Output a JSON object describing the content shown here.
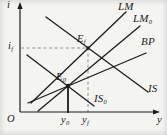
{
  "figure": {
    "type": "economics-diagram",
    "model": "IS-LM-BP",
    "colors": {
      "background": "#f4f5f1",
      "ink": "#1c1c1c",
      "guide": "#8f9089"
    },
    "axes": {
      "y_axis_label": {
        "base": "i",
        "sub": ""
      },
      "x_axis_label": {
        "base": "y",
        "sub": ""
      },
      "origin_label": {
        "base": "O",
        "sub": ""
      }
    },
    "curves": [
      {
        "name": "lm-curve",
        "label": {
          "base": "LM",
          "sub": ""
        },
        "x1": 31,
        "y1": 103,
        "x2": 126,
        "y2": 12,
        "label_x": 118,
        "label_y": 1
      },
      {
        "name": "lm0-curve",
        "label": {
          "base": "LM",
          "sub": "0"
        },
        "x1": 38,
        "y1": 111,
        "x2": 140,
        "y2": 26,
        "label_x": 133,
        "label_y": 13
      },
      {
        "name": "bp-curve",
        "label": {
          "base": "BP",
          "sub": ""
        },
        "x1": 28,
        "y1": 103,
        "x2": 146,
        "y2": 53,
        "label_x": 141,
        "label_y": 36
      },
      {
        "name": "is-curve",
        "label": {
          "base": "IS",
          "sub": ""
        },
        "x1": 46,
        "y1": 17,
        "x2": 148,
        "y2": 92,
        "label_x": 148,
        "label_y": 83
      },
      {
        "name": "is0-curve",
        "label": {
          "base": "IS",
          "sub": "0"
        },
        "x1": 27,
        "y1": 55,
        "x2": 94,
        "y2": 106,
        "label_x": 94,
        "label_y": 93
      }
    ],
    "points": [
      {
        "name": "ef-point",
        "label": {
          "base": "E",
          "sub": "f"
        },
        "x": 88,
        "y": 48,
        "r": 1.7,
        "label_x": 77,
        "label_y": 33
      },
      {
        "name": "e0-point",
        "label": {
          "base": "E",
          "sub": "0"
        },
        "x": 68,
        "y": 86,
        "r": 2.2,
        "label_x": 56,
        "label_y": 71
      }
    ],
    "guides": [
      {
        "name": "if-dashed-horizontal",
        "x1": 21,
        "y1": 48,
        "x2": 88,
        "y2": 48,
        "style": "dashed"
      },
      {
        "name": "yf-dashed-vertical",
        "x1": 88,
        "y1": 48,
        "x2": 88,
        "y2": 112,
        "style": "dashed"
      },
      {
        "name": "y0-solid-vertical",
        "x1": 68,
        "y1": 86,
        "x2": 68,
        "y2": 113,
        "style": "solid"
      }
    ],
    "tick_labels": [
      {
        "name": "if-tick-label",
        "label": {
          "base": "i",
          "sub": "f"
        },
        "x": 8,
        "y": 40
      },
      {
        "name": "y0-tick-label",
        "label": {
          "base": "y",
          "sub": "0"
        },
        "x": 61,
        "y": 114
      },
      {
        "name": "yf-tick-label",
        "label": {
          "base": "y",
          "sub": "f"
        },
        "x": 82,
        "y": 114
      }
    ],
    "axis_labels": [
      {
        "name": "i-axis-label",
        "key": "y_axis_label",
        "x": 7,
        "y": -1
      },
      {
        "name": "y-axis-label",
        "key": "x_axis_label",
        "x": 157,
        "y": 114
      },
      {
        "name": "origin-label",
        "key": "origin_label",
        "x": 7,
        "y": 113
      }
    ]
  }
}
